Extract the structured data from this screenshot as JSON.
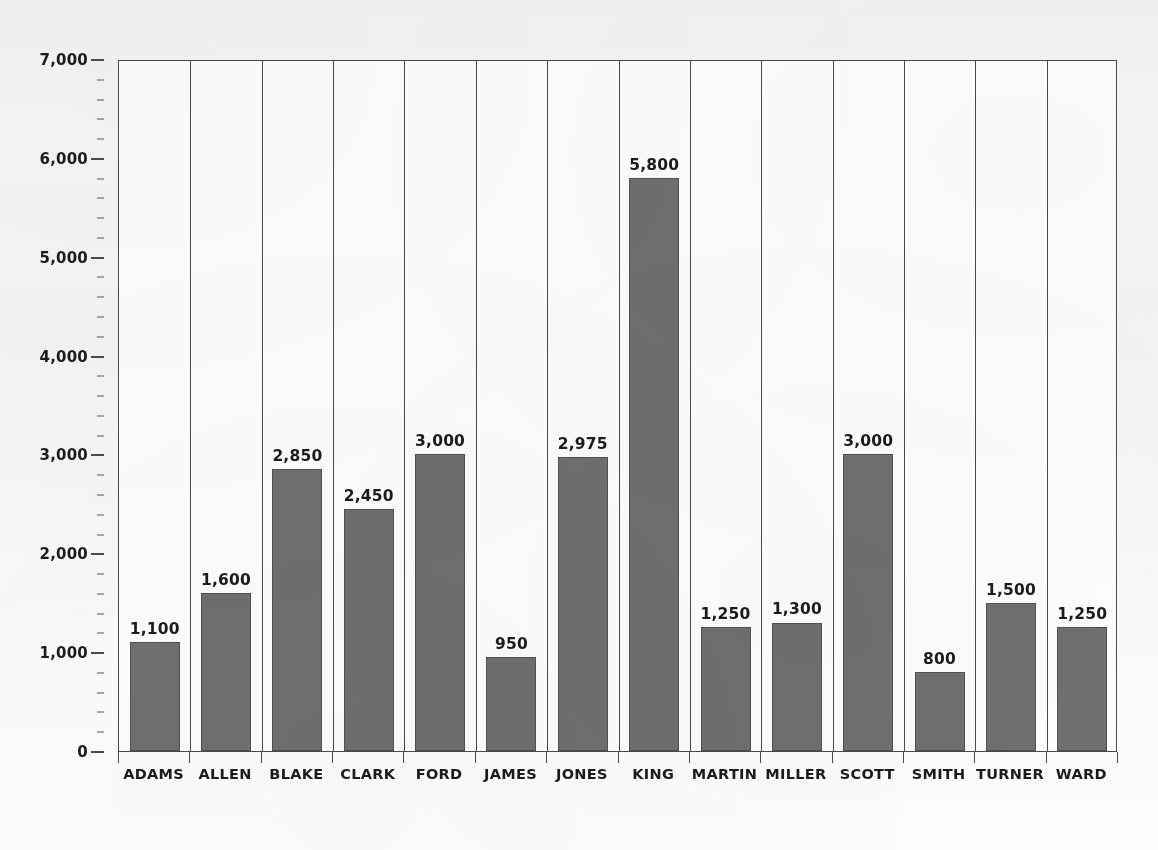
{
  "chart_data": {
    "type": "bar",
    "title": "",
    "xlabel": "",
    "ylabel": "",
    "ylim": [
      0,
      7000
    ],
    "y_major_step": 1000,
    "y_minor_step": 200,
    "grid": false,
    "legend": null,
    "categories": [
      "ADAMS",
      "ALLEN",
      "BLAKE",
      "CLARK",
      "FORD",
      "JAMES",
      "JONES",
      "KING",
      "MARTIN",
      "MILLER",
      "SCOTT",
      "SMITH",
      "TURNER",
      "WARD"
    ],
    "values": [
      1100,
      1600,
      2850,
      2450,
      3000,
      950,
      2975,
      5800,
      1250,
      1300,
      3000,
      800,
      1500,
      1250
    ],
    "value_labels": [
      "1,100",
      "1,600",
      "2,850",
      "2,450",
      "3,000",
      "950",
      "2,975",
      "5,800",
      "1,250",
      "1,300",
      "3,000",
      "800",
      "1,500",
      "1,250"
    ],
    "y_tick_labels": [
      "0",
      "1,000",
      "2,000",
      "3,000",
      "4,000",
      "5,000",
      "6,000",
      "7,000"
    ],
    "y_tick_values": [
      0,
      1000,
      2000,
      3000,
      4000,
      5000,
      6000,
      7000
    ],
    "bar_color": "#6f6f6f",
    "bar_border_color": "#4f4f4f",
    "axis_color": "#4a4a4a",
    "text_color": "#1b1b1b",
    "plot_background": "#fdfdfc",
    "page_background": "#f5f5f3"
  }
}
